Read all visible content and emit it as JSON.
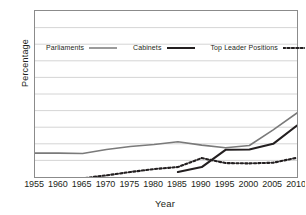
{
  "chart_data": {
    "type": "line",
    "title": "",
    "xlabel": "Year",
    "ylabel": "Percentage",
    "xlim": [
      1955,
      2010
    ],
    "ylim": [
      0,
      50
    ],
    "grid": "horizontal",
    "legend_position": "upper-left-inside",
    "xticks": [
      1955,
      1960,
      1965,
      1970,
      1975,
      1980,
      1985,
      1990,
      1995,
      2000,
      2005,
      2010
    ],
    "yticks": [
      0,
      5,
      10,
      15,
      20,
      25,
      30,
      35,
      40,
      45,
      50
    ],
    "series": [
      {
        "name": "Parliaments",
        "style": "solid",
        "color": "#7a7a7a",
        "width": 1.6,
        "x": [
          1955,
          1960,
          1965,
          1970,
          1975,
          1980,
          1985,
          1990,
          1995,
          2000,
          2005,
          2010
        ],
        "values": [
          7.2,
          7.2,
          7.1,
          8.3,
          9.2,
          9.8,
          10.6,
          9.6,
          8.8,
          9.5,
          14.2,
          19.3
        ]
      },
      {
        "name": "Cabinets",
        "style": "solid",
        "color": "#231f20",
        "width": 2.1,
        "x": [
          1985,
          1990,
          1995,
          2000,
          2005,
          2010
        ],
        "values": [
          1.5,
          3.0,
          8.2,
          8.3,
          10.0,
          15.5
        ]
      },
      {
        "name": "Top Leader Positions",
        "style": "dotted",
        "color": "#231f20",
        "width": 2.1,
        "x": [
          1960,
          1965,
          1970,
          1975,
          1980,
          1985,
          1990,
          1995,
          2000,
          2005,
          2010
        ],
        "values": [
          -0.6,
          -0.4,
          0.5,
          1.5,
          2.4,
          3.0,
          5.7,
          4.2,
          4.1,
          4.3,
          5.8
        ]
      }
    ]
  },
  "legend": {
    "items": [
      {
        "label": "Parliaments"
      },
      {
        "label": "Cabinets"
      },
      {
        "label": "Top Leader Positions"
      }
    ]
  },
  "axes": {
    "y_title": "Percentage",
    "x_title": "Year"
  }
}
